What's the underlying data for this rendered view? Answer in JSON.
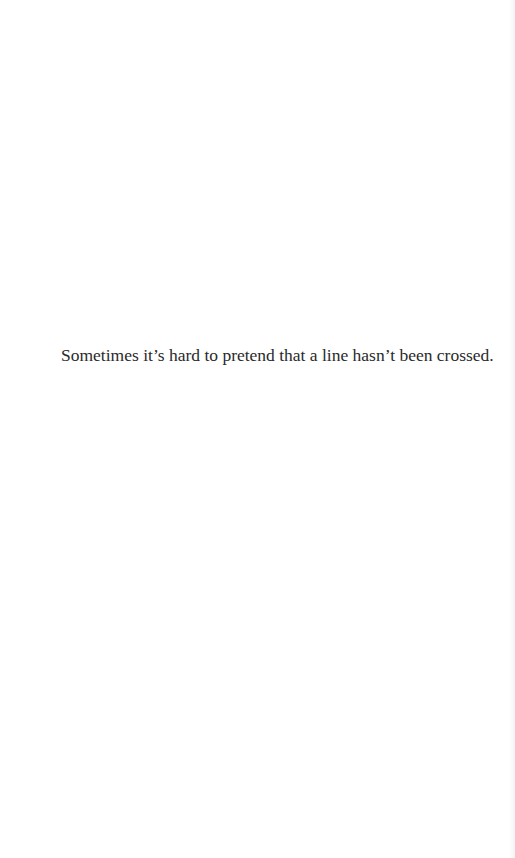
{
  "page": {
    "epigraph": "Sometimes it’s hard to pretend that a line hasn’t been crossed."
  }
}
